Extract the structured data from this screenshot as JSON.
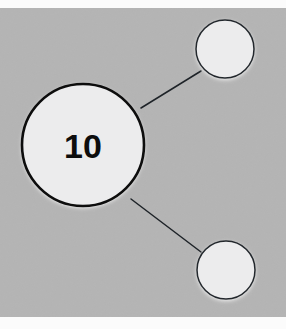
{
  "diagram": {
    "canvas": {
      "width": 286,
      "height": 329,
      "background_color": "#b4b4b4",
      "band_color": "#fbfbfb",
      "top_band_height": 8,
      "bottom_band_height": 12
    },
    "nodes": [
      {
        "id": "main",
        "label": "10",
        "cx": 83,
        "cy": 145,
        "r": 61,
        "fill": "#ececed",
        "stroke": "#0d0d0d",
        "stroke_width": 2.6,
        "font_size": 34,
        "has_shadow": true
      },
      {
        "id": "top-right",
        "label": "",
        "cx": 225,
        "cy": 49,
        "r": 29,
        "fill": "#ececed",
        "stroke": "#23282d",
        "stroke_width": 1.5,
        "font_size": 18,
        "has_shadow": true
      },
      {
        "id": "bottom-right",
        "label": "",
        "cx": 226,
        "cy": 270,
        "r": 29,
        "fill": "#ececed",
        "stroke": "#23282d",
        "stroke_width": 1.5,
        "font_size": 18,
        "has_shadow": true
      }
    ],
    "edges": [
      {
        "id": "main-to-top-right",
        "from": "main",
        "to": "top-right",
        "x1": 141,
        "y1": 108,
        "x2": 201,
        "y2": 71,
        "stroke": "#1e2328",
        "stroke_width": 1.5
      },
      {
        "id": "main-to-bottom-right",
        "from": "main",
        "to": "bottom-right",
        "x1": 131,
        "y1": 199,
        "x2": 201,
        "y2": 252,
        "stroke": "#1e2328",
        "stroke_width": 1.5
      }
    ]
  }
}
